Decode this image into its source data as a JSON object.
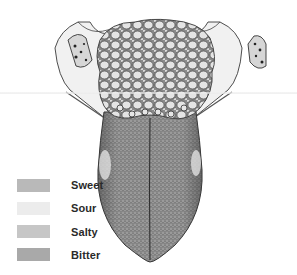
{
  "figure": {
    "style": "grayscale pen-and-ink stipple drawing"
  },
  "legend": {
    "items": [
      {
        "label": "Sweet",
        "color": "#b9b9b9"
      },
      {
        "label": "Sour",
        "color": "#ececec"
      },
      {
        "label": "Salty",
        "color": "#c6c6c6"
      },
      {
        "label": "Bitter",
        "color": "#a9a9a9"
      }
    ]
  },
  "colors": {
    "ink": "#333333",
    "tongue_body": "#8f8f8f",
    "papillae_fill": "#e2e2e2",
    "background": "#ffffff"
  }
}
